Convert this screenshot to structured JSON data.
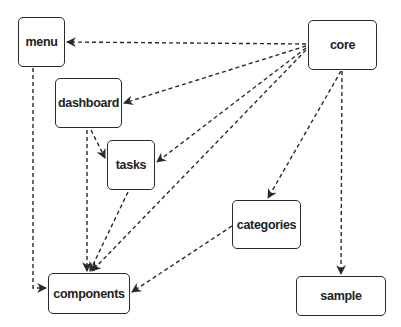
{
  "diagram": {
    "type": "dependency-graph",
    "nodes": {
      "menu": {
        "label": "menu"
      },
      "core": {
        "label": "core"
      },
      "dashboard": {
        "label": "dashboard"
      },
      "tasks": {
        "label": "tasks"
      },
      "categories": {
        "label": "categories"
      },
      "components": {
        "label": "components"
      },
      "sample": {
        "label": "sample"
      }
    },
    "edges": [
      {
        "from": "core",
        "to": "menu",
        "style": "dashed"
      },
      {
        "from": "core",
        "to": "dashboard",
        "style": "dashed"
      },
      {
        "from": "core",
        "to": "tasks",
        "style": "dashed"
      },
      {
        "from": "core",
        "to": "components",
        "style": "dashed"
      },
      {
        "from": "core",
        "to": "categories",
        "style": "dashed"
      },
      {
        "from": "core",
        "to": "sample",
        "style": "dashed"
      },
      {
        "from": "menu",
        "to": "components",
        "style": "dashed"
      },
      {
        "from": "dashboard",
        "to": "tasks",
        "style": "dashed"
      },
      {
        "from": "dashboard",
        "to": "components",
        "style": "dashed"
      },
      {
        "from": "tasks",
        "to": "components",
        "style": "dashed"
      },
      {
        "from": "categories",
        "to": "components",
        "style": "dashed"
      }
    ],
    "colors": {
      "stroke": "#2a2a2a",
      "background": "#ffffff"
    }
  }
}
